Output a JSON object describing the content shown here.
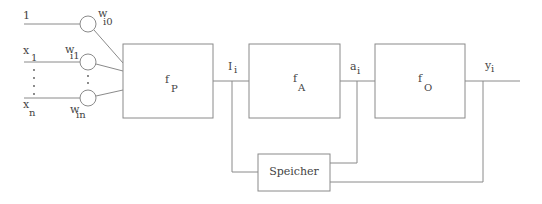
{
  "diagram": {
    "inputs": [
      {
        "label": "1",
        "weight_main": "w",
        "weight_sub": "i0"
      },
      {
        "label_main": "x",
        "label_sub": "1",
        "weight_main": "w",
        "weight_sub": "i1"
      },
      {
        "label_main": "x",
        "label_sub": "n",
        "weight_main": "w",
        "weight_sub": "in"
      }
    ],
    "ellipsis": "⋮",
    "blocks": [
      {
        "id": "fP",
        "main": "f",
        "sub": "P"
      },
      {
        "id": "fA",
        "main": "f",
        "sub": "A"
      },
      {
        "id": "fO",
        "main": "f",
        "sub": "O"
      }
    ],
    "signals": [
      {
        "main": "I",
        "sub": "i"
      },
      {
        "main": "a",
        "sub": "i"
      },
      {
        "main": "y",
        "sub": "i"
      }
    ],
    "memory": {
      "label": "Speicher"
    },
    "colors": {
      "line": "#8a8a8a",
      "text": "#444444",
      "background": "#ffffff"
    }
  }
}
